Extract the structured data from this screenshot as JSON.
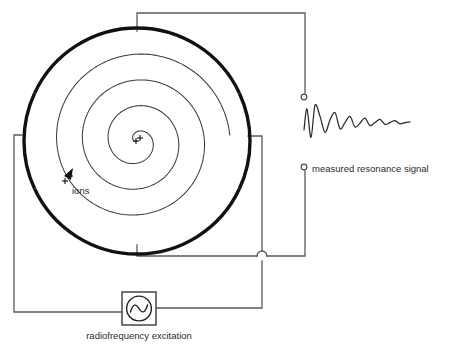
{
  "diagram": {
    "labels": {
      "ions": "ions",
      "measured_signal": "measured resonance signal",
      "rf_excitation": "radiofrequency excitation"
    },
    "colors": {
      "background": "#ffffff",
      "wire": "#5a5a5a",
      "electrode": "#111111",
      "spiral": "#3d3d3d",
      "signal": "#2a2a2a",
      "text": "#2b2b2b"
    },
    "components": [
      {
        "name": "icr-cell",
        "type": "cell",
        "center_x": 137,
        "center_y": 141,
        "radius": 113,
        "electrode_count": 4,
        "electrode_names": [
          "top-electrode",
          "right-electrode",
          "bottom-electrode",
          "left-electrode"
        ]
      },
      {
        "name": "ion-spiral",
        "type": "spiral",
        "turns": 3.6,
        "center_x": 137,
        "center_y": 141,
        "max_radius": 93
      },
      {
        "name": "rf-source",
        "type": "ac-source",
        "x": 122,
        "y": 292,
        "width": 34,
        "height": 33
      },
      {
        "name": "detection-terminals",
        "type": "terminal-pair",
        "top_x": 304,
        "top_y": 97,
        "bottom_x": 304,
        "bottom_y": 167
      },
      {
        "name": "resonance-waveform",
        "type": "damped-oscillation",
        "baseline_y": 130,
        "start_x": 304,
        "end_x": 410
      },
      {
        "name": "wire-hop",
        "type": "crossover",
        "x": 262,
        "y": 256
      }
    ],
    "annotations": {
      "ion_charge_symbols": "++",
      "ion_arrow_direction": "clockwise-outward"
    }
  },
  "chart_data": {
    "type": "line",
    "title": "measured resonance signal",
    "xlabel": "",
    "ylabel": "",
    "series": [
      {
        "name": "free induction decay",
        "description": "damped sinusoidal transient of ion image current",
        "x": [
          0,
          3,
          7,
          11,
          16,
          21,
          26,
          31,
          36,
          41,
          46,
          51,
          56,
          61,
          66,
          71,
          76,
          81,
          86,
          91,
          96,
          101,
          106
        ],
        "y": [
          0,
          34,
          -12,
          40,
          22,
          -4,
          16,
          28,
          2,
          12,
          22,
          5,
          11,
          19,
          7,
          12,
          17,
          9,
          12,
          15,
          10,
          12,
          13
        ]
      }
    ],
    "grid": false,
    "legend": false
  }
}
